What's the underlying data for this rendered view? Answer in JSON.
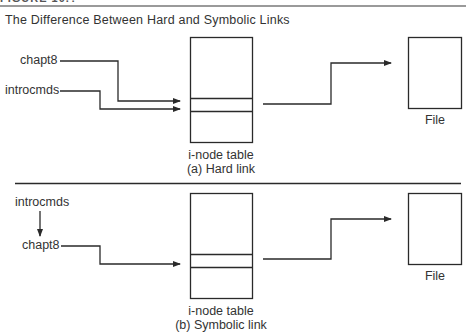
{
  "figure": {
    "number": "FIGURE 10.?",
    "title": "The Difference Between Hard and Symbolic Links"
  },
  "panels": [
    {
      "id": "a",
      "links": [
        "chapt8",
        "introcmds"
      ],
      "table_label": "i-node table",
      "caption": "(a) Hard link",
      "file_label": "File"
    },
    {
      "id": "b",
      "links": [
        "introcmds",
        "chapt8"
      ],
      "table_label": "i-node table",
      "caption": "(b) Symbolic link",
      "file_label": "File"
    }
  ],
  "colors": {
    "line": "#2a2a2a",
    "rule": "#9a9a9a",
    "text": "#333333"
  }
}
